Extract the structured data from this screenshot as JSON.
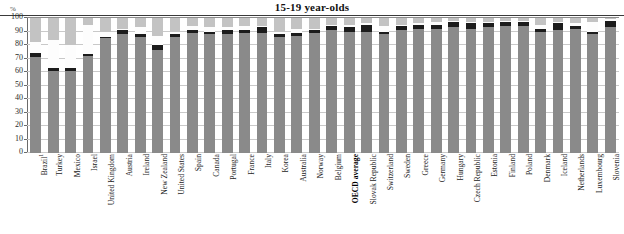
{
  "header": {
    "title": "15-19 year-olds",
    "axis_unit": "%"
  },
  "chart_data": {
    "type": "bar",
    "subtype": "stacked-bar",
    "title": "15-19 year-olds",
    "xlabel": "",
    "ylabel": "%",
    "ylim": [
      0,
      100
    ],
    "yticks": [
      0,
      10,
      20,
      30,
      40,
      50,
      60,
      70,
      80,
      90,
      100
    ],
    "ytick_labels": [
      "0",
      "10",
      "20",
      "30",
      "40",
      "50",
      "60",
      "70",
      "80",
      "90",
      "100"
    ],
    "grid": true,
    "legend": "none",
    "stacked_total": 100,
    "colors": {
      "series_a": "#8a8a8a",
      "series_b": "#1c1c1c",
      "series_c": "#fdfdfd",
      "series_d": "#c3c3c3"
    },
    "categories": [
      "Brazil",
      "Turkey",
      "Mexico",
      "Israel",
      "United Kingdom",
      "Austria",
      "Ireland",
      "New Zealand",
      "United States",
      "Spain",
      "Canada",
      "Portugal",
      "France",
      "Italy",
      "Korea",
      "Australia",
      "Norway",
      "Belgium",
      "OECD average",
      "Slovak Republic",
      "Switzerland",
      "Sweden",
      "Greece",
      "Germany",
      "Hungary",
      "Czech Republic",
      "Estonia",
      "Finland",
      "Poland",
      "Denmark",
      "Iceland",
      "Netherlands",
      "Luxembourg",
      "Slovenia"
    ],
    "category_notes": {
      "Brazil": "1"
    },
    "highlighted_category": "OECD average",
    "series": [
      {
        "name": "series_a",
        "values": [
          71,
          61,
          61,
          72,
          85,
          88,
          86,
          76,
          86,
          89,
          88,
          88,
          89,
          89,
          86,
          87,
          89,
          91,
          90,
          90,
          88,
          91,
          92,
          92,
          93,
          92,
          93,
          94,
          94,
          90,
          91,
          92,
          88,
          93
        ]
      },
      {
        "name": "series_b",
        "values": [
          3,
          2,
          2,
          1,
          1,
          3,
          2,
          4,
          2,
          2,
          2,
          3,
          2,
          4,
          2,
          2,
          2,
          3,
          3,
          5,
          2,
          3,
          3,
          3,
          4,
          4,
          3,
          3,
          3,
          2,
          5,
          2,
          2,
          5
        ]
      },
      {
        "name": "series_c",
        "values": [
          8,
          21,
          17,
          22,
          4,
          1,
          5,
          7,
          2,
          3,
          3,
          2,
          3,
          1,
          2,
          3,
          1,
          1,
          2,
          1,
          4,
          1,
          1,
          2,
          1,
          1,
          1,
          1,
          1,
          3,
          1,
          2,
          7,
          1
        ]
      },
      {
        "name": "series_d",
        "values": [
          18,
          16,
          20,
          5,
          10,
          8,
          7,
          13,
          10,
          6,
          7,
          7,
          6,
          6,
          10,
          8,
          8,
          5,
          5,
          4,
          6,
          5,
          4,
          3,
          2,
          3,
          3,
          2,
          2,
          5,
          3,
          4,
          3,
          1
        ]
      }
    ]
  }
}
